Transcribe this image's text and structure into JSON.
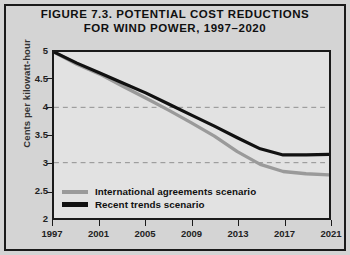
{
  "figure": {
    "title_line1": "FIGURE 7.3. POTENTIAL COST REDUCTIONS",
    "title_line2": "FOR WIND POWER, 1997–2020",
    "background_color": "#d4d4d4",
    "plot_background_color": "#e2e2e2",
    "frame_color": "#1a1a1a"
  },
  "chart_data": {
    "type": "line",
    "title": "FIGURE 7.3. POTENTIAL COST REDUCTIONS FOR WIND POWER, 1997–2020",
    "xlabel": "",
    "ylabel": "Cents per kilowatt-hour",
    "xlim": [
      1997,
      2021
    ],
    "ylim": [
      2,
      5
    ],
    "xticks": [
      1997,
      2001,
      2005,
      2009,
      2013,
      2017,
      2021
    ],
    "xtick_labels": [
      "1997",
      "2001",
      "2005",
      "2009",
      "2013",
      "2017",
      "2021"
    ],
    "yticks": [
      2,
      2.5,
      3,
      3.5,
      4,
      4.5,
      5
    ],
    "ytick_labels": [
      "2",
      "2.5",
      "3",
      "3.5",
      "4",
      "4.5",
      "5"
    ],
    "gridlines_y": [
      3,
      4
    ],
    "grid": "dashed-horizontal",
    "legend_position": "bottom-left-inside",
    "x": [
      1997,
      1999,
      2001,
      2003,
      2005,
      2007,
      2009,
      2011,
      2013,
      2015,
      2017,
      2019,
      2021
    ],
    "series": [
      {
        "name": "International agreements scenario",
        "color": "#9a9a9a",
        "values": [
          5.0,
          4.78,
          4.6,
          4.38,
          4.17,
          3.95,
          3.72,
          3.48,
          3.2,
          2.97,
          2.84,
          2.8,
          2.78
        ]
      },
      {
        "name": "Recent trends scenario",
        "color": "#111111",
        "values": [
          5.0,
          4.8,
          4.62,
          4.44,
          4.26,
          4.06,
          3.86,
          3.66,
          3.45,
          3.25,
          3.14,
          3.14,
          3.15
        ]
      }
    ]
  },
  "legend": {
    "items": [
      {
        "label": "International agreements scenario",
        "color": "#9a9a9a"
      },
      {
        "label": "Recent trends scenario",
        "color": "#111111"
      }
    ]
  }
}
